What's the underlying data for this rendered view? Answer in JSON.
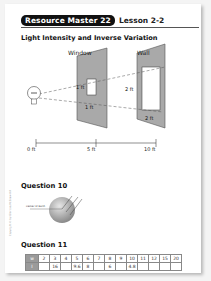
{
  "header": {
    "badge": "Resource Master 22",
    "lesson": "Lesson 2-2"
  },
  "title": "Light Intensity and Inverse Variation",
  "diagram": {
    "window_label": "Window",
    "wall_label": "Wall",
    "window_height": "1 ft",
    "window_width": "1 ft",
    "wall_height": "2 ft",
    "wall_width": "2 ft",
    "axis": [
      "0 ft",
      "5 ft",
      "10 ft"
    ],
    "colors": {
      "panel": "#a9a9a9",
      "panel_edge": "#555555"
    }
  },
  "question10": {
    "heading": "Question 10",
    "label": "Center of Earth"
  },
  "question11": {
    "heading": "Question 11",
    "table": {
      "row_labels": [
        "w",
        "I"
      ],
      "w": [
        "2",
        "3",
        "4",
        "5",
        "6",
        "7",
        "8",
        "9",
        "10",
        "11",
        "12",
        "15",
        "20"
      ],
      "I": [
        "",
        "16",
        "",
        "9.6",
        "8",
        "",
        "6",
        "",
        "4.8",
        "",
        "",
        "",
        ""
      ]
    }
  },
  "side_text": "Copyright © by Glencoe/McGraw-Hill"
}
